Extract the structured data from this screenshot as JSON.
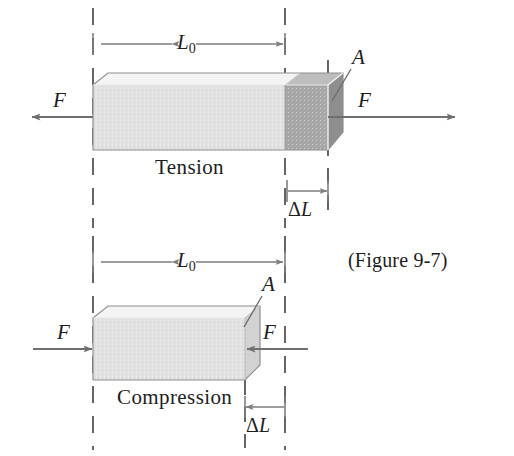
{
  "figure": {
    "caption": "(Figure 9-7)",
    "colors": {
      "background": "#ffffff",
      "ink": "#1d1d1d",
      "line": "#6f6f6f",
      "dash": "#4a4a4a",
      "bar_front": "#e2e2e2",
      "bar_top": "#f2f2f2",
      "bar_side": "#c9c9c9",
      "bar_stretch_front": "#a8a8a8",
      "bar_stretch_top": "#bdbdbd",
      "bar_stretch_side": "#8e8e8e",
      "bar_outline": "#8a8a8a"
    },
    "panels": [
      {
        "id": "tension",
        "mode_label": "Tension",
        "length_label": "L",
        "length_subscript": "0",
        "delta_label": "Δ",
        "delta_symbol": "L",
        "area_label": "A",
        "force_label_left": "F",
        "force_label_right": "F",
        "force_direction_left": "left",
        "force_direction_right": "right",
        "delta_arrow_direction": "right"
      },
      {
        "id": "compression",
        "mode_label": "Compression",
        "length_label": "L",
        "length_subscript": "0",
        "delta_label": "Δ",
        "delta_symbol": "L",
        "area_label": "A",
        "force_label_left": "F",
        "force_label_right": "F",
        "force_direction_left": "right",
        "force_direction_right": "left",
        "delta_arrow_direction": "left"
      }
    ]
  }
}
